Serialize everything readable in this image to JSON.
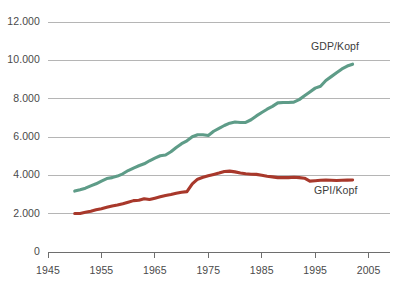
{
  "chart_data": {
    "type": "line",
    "title": "",
    "subtitle": "",
    "xlabel": "",
    "ylabel": "",
    "xlim": [
      1945,
      2009
    ],
    "ylim": [
      0,
      12000
    ],
    "grid": true,
    "grid_axis": "y",
    "legend_position": "inline-right",
    "number_format": "de-DE (thousands separator '.')",
    "x_ticks": [
      1945,
      1955,
      1965,
      1975,
      1985,
      1995,
      2005
    ],
    "x_tick_labels": [
      "1945",
      "1955",
      "1965",
      "1975",
      "1985",
      "1995",
      "2005"
    ],
    "y_ticks": [
      0,
      2000,
      4000,
      6000,
      8000,
      10000,
      12000
    ],
    "y_tick_labels": [
      "0",
      "2.000",
      "4.000",
      "6.000",
      "8.000",
      "10.000",
      "12.000"
    ],
    "series": [
      {
        "name": "GDP/Kopf",
        "color": "#5e9c88",
        "label_text": "GDP/Kopf",
        "x": [
          1950,
          1951,
          1952,
          1953,
          1954,
          1955,
          1956,
          1957,
          1958,
          1959,
          1960,
          1961,
          1962,
          1963,
          1964,
          1965,
          1966,
          1967,
          1968,
          1969,
          1970,
          1971,
          1972,
          1973,
          1974,
          1975,
          1976,
          1977,
          1978,
          1979,
          1980,
          1981,
          1982,
          1983,
          1984,
          1985,
          1986,
          1987,
          1988,
          1989,
          1990,
          1991,
          1992,
          1993,
          1994,
          1995,
          1996,
          1997,
          1998,
          1999,
          2000,
          2001,
          2002
        ],
        "values": [
          3180,
          3250,
          3330,
          3450,
          3560,
          3700,
          3830,
          3880,
          3960,
          4080,
          4250,
          4380,
          4500,
          4600,
          4760,
          4900,
          5020,
          5060,
          5230,
          5450,
          5650,
          5800,
          6010,
          6120,
          6120,
          6080,
          6300,
          6450,
          6600,
          6720,
          6780,
          6760,
          6760,
          6900,
          7100,
          7280,
          7450,
          7600,
          7780,
          7800,
          7800,
          7820,
          7950,
          8150,
          8350,
          8550,
          8650,
          8950,
          9150,
          9350,
          9550,
          9700,
          9800
        ]
      },
      {
        "name": "GPI/Kopf",
        "color": "#a8382b",
        "label_text": "GPI/Kopf",
        "x": [
          1950,
          1951,
          1952,
          1953,
          1954,
          1955,
          1956,
          1957,
          1958,
          1959,
          1960,
          1961,
          1962,
          1963,
          1964,
          1965,
          1966,
          1967,
          1968,
          1969,
          1970,
          1971,
          1972,
          1973,
          1974,
          1975,
          1976,
          1977,
          1978,
          1979,
          1980,
          1981,
          1982,
          1983,
          1984,
          1985,
          1986,
          1987,
          1988,
          1989,
          1990,
          1991,
          1992,
          1993,
          1994,
          1995,
          1996,
          1997,
          1998,
          1999,
          2000,
          2001,
          2002
        ],
        "values": [
          2010,
          2010,
          2070,
          2130,
          2200,
          2260,
          2330,
          2400,
          2450,
          2520,
          2600,
          2680,
          2700,
          2780,
          2740,
          2810,
          2880,
          2950,
          3000,
          3060,
          3120,
          3150,
          3550,
          3800,
          3900,
          3980,
          4050,
          4120,
          4200,
          4220,
          4180,
          4120,
          4080,
          4060,
          4050,
          4000,
          3950,
          3920,
          3880,
          3880,
          3880,
          3900,
          3880,
          3850,
          3700,
          3720,
          3740,
          3750,
          3740,
          3730,
          3740,
          3750,
          3760
        ]
      }
    ]
  },
  "axis": {
    "baseline_label": "0"
  }
}
